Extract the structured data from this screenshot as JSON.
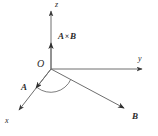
{
  "figure": {
    "kind": "vector-cross-product-diagram",
    "width": 158,
    "height": 136,
    "background_color": "#ffffff",
    "line_color": "#6e6e6e",
    "text_color": "#2b2b2b"
  },
  "labels": {
    "z_axis": "z",
    "y_axis": "y",
    "x_axis": "x",
    "origin": "O",
    "vector_a": "A",
    "vector_b": "B",
    "cross_product_operand_a": "A",
    "cross_product_symbol": "×",
    "cross_product_operand_b": "B"
  },
  "geometry": {
    "origin": {
      "x": 51,
      "y": 69
    },
    "z_axis_tip": {
      "x": 51,
      "y": 8
    },
    "y_axis_tip": {
      "x": 146,
      "y": 69
    },
    "x_axis_tip": {
      "x": 16,
      "y": 113
    },
    "cross_product_arrow_tip": {
      "x": 51,
      "y": 40
    },
    "vector_a_tip": {
      "x": 33,
      "y": 91
    },
    "vector_b_tip": {
      "x": 128,
      "y": 111
    },
    "angle_arc_radius": 22
  }
}
